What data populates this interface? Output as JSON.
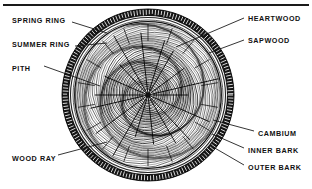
{
  "figure": {
    "title_visible": false,
    "background_color": "#ffffff",
    "ink_color": "#111111",
    "top_rule": true
  },
  "labels": {
    "spring_ring": "SPRING RING",
    "summer_ring": "SUMMER RING",
    "pith": "PITH",
    "wood_ray": "WOOD RAY",
    "heartwood": "HEARTWOOD",
    "sapwood": "SAPWOOD",
    "cambium": "CAMBIUM",
    "inner_bark": "INNER BARK",
    "outer_bark": "OUTER BARK"
  },
  "label_positions": {
    "spring_ring": {
      "x": 12,
      "y": 16,
      "side": "left"
    },
    "summer_ring": {
      "x": 12,
      "y": 40,
      "side": "left"
    },
    "pith": {
      "x": 12,
      "y": 64,
      "side": "left"
    },
    "wood_ray": {
      "x": 12,
      "y": 154,
      "side": "left"
    },
    "heartwood": {
      "x": 248,
      "y": 14,
      "side": "right"
    },
    "sapwood": {
      "x": 248,
      "y": 36,
      "side": "right"
    },
    "cambium": {
      "x": 258,
      "y": 129,
      "side": "right"
    },
    "inner_bark": {
      "x": 248,
      "y": 146,
      "side": "right"
    },
    "outer_bark": {
      "x": 248,
      "y": 163,
      "side": "right"
    }
  },
  "diagram_geometry": {
    "center": {
      "x": 148,
      "y": 95
    },
    "outer_bark_radius": 86,
    "inner_bark_radius": 79,
    "cambium_radius": 74,
    "sapwood_outer_radius": 73,
    "sapwood_inner_radius": 48,
    "heartwood_radius": 48,
    "pith_radius": 3,
    "growth_ring_count": 30,
    "wood_ray_count": 18
  },
  "leader_lines": {
    "spring_ring": {
      "from": [
        72,
        22
      ],
      "to": [
        107,
        33
      ]
    },
    "summer_ring": {
      "from": [
        75,
        46
      ],
      "to": [
        107,
        43
      ]
    },
    "pith": {
      "from": [
        44,
        66
      ],
      "to": [
        100,
        86
      ]
    },
    "wood_ray": {
      "from": [
        58,
        155
      ],
      "to": [
        107,
        142
      ]
    },
    "heartwood": {
      "from": [
        244,
        18
      ],
      "to": [
        176,
        47
      ]
    },
    "sapwood": {
      "from": [
        244,
        40
      ],
      "to": [
        209,
        53
      ]
    },
    "cambium": {
      "from": [
        254,
        131
      ],
      "to": [
        213,
        120
      ]
    },
    "inner_bark": {
      "from": [
        244,
        148
      ],
      "to": [
        212,
        134
      ]
    },
    "outer_bark": {
      "from": [
        244,
        165
      ],
      "to": [
        213,
        147
      ]
    }
  }
}
